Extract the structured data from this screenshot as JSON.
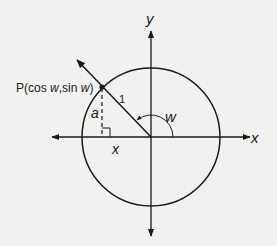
{
  "diagram": {
    "type": "unit-circle",
    "colors": {
      "background": "#f1f1f0",
      "stroke": "#1a1a1a"
    },
    "axes": {
      "x_label": "x",
      "y_label": "y"
    },
    "point": {
      "label_prefix": "P(cos ",
      "label_w1": "w",
      "label_mid": ",sin ",
      "label_w2": "w",
      "label_suffix": ")"
    },
    "labels": {
      "radius": "1",
      "angle": "w",
      "vertical_leg": "a",
      "horizontal_leg": "x"
    }
  }
}
